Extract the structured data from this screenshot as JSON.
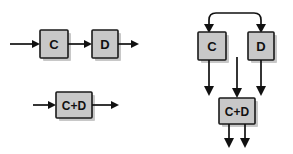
{
  "figure": {
    "background_color": "#ffffff",
    "box_fill": "#c8c8c8",
    "box_stroke": "#1a1a1a",
    "line_color": "#111111",
    "width": 293,
    "height": 154
  },
  "panels": [
    {
      "id": "left-top",
      "name": "serial-chain",
      "boxes": [
        {
          "id": "c",
          "label": "C",
          "x": 40,
          "y": 30,
          "w": 28,
          "h": 28
        },
        {
          "id": "d",
          "label": "D",
          "x": 92,
          "y": 30,
          "w": 26,
          "h": 28
        }
      ],
      "arrows": [
        {
          "id": "in-c",
          "from": "input",
          "to": "c",
          "direction": "right"
        },
        {
          "id": "c-to-d",
          "from": "c",
          "to": "d",
          "direction": "right"
        },
        {
          "id": "d-out",
          "from": "d",
          "to": "output",
          "direction": "right"
        }
      ]
    },
    {
      "id": "left-bottom",
      "name": "combined-single-block",
      "boxes": [
        {
          "id": "cd",
          "label": "C+D",
          "x": 56,
          "y": 92,
          "w": 36,
          "h": 26
        }
      ],
      "arrows": [
        {
          "id": "in-cd",
          "from": "input",
          "to": "cd",
          "direction": "right"
        },
        {
          "id": "cd-out",
          "from": "cd",
          "to": "output",
          "direction": "right"
        }
      ]
    },
    {
      "id": "right",
      "name": "parallel-with-feedback",
      "boxes": [
        {
          "id": "c2",
          "label": "C",
          "x": 198,
          "y": 32,
          "w": 28,
          "h": 28
        },
        {
          "id": "d2",
          "label": "D",
          "x": 248,
          "y": 32,
          "w": 26,
          "h": 28
        },
        {
          "id": "cd2",
          "label": "C+D",
          "x": 219,
          "y": 98,
          "w": 36,
          "h": 26
        }
      ],
      "arrows": [
        {
          "id": "bridge-to-c",
          "from": "split",
          "to": "c2",
          "direction": "down",
          "shape": "curved"
        },
        {
          "id": "bridge-to-d",
          "from": "split",
          "to": "d2",
          "direction": "down",
          "shape": "curved"
        },
        {
          "id": "c2-down",
          "from": "c2",
          "to": "output",
          "direction": "down"
        },
        {
          "id": "mid-into-cd",
          "from": "input",
          "to": "cd2",
          "direction": "down"
        },
        {
          "id": "d2-down",
          "from": "d2",
          "to": "output",
          "direction": "down"
        },
        {
          "id": "cd2-out-left",
          "from": "cd2",
          "to": "output",
          "direction": "down"
        },
        {
          "id": "cd2-out-right",
          "from": "cd2",
          "to": "output",
          "direction": "down"
        }
      ]
    }
  ],
  "labels": {
    "c": "C",
    "d": "D",
    "cd": "C+D",
    "c_right": "C",
    "d_right": "D",
    "cd_right": "C+D"
  }
}
